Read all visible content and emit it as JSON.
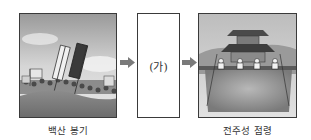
{
  "diagram": {
    "type": "sequence",
    "steps": [
      {
        "label": "백산 봉기",
        "image": "donghak-peasant-army-uprising-illustration"
      },
      {
        "label": "(가)",
        "image": null
      },
      {
        "label": "전주성 점령",
        "image": "jeonju-fortress-occupation-illustration"
      }
    ],
    "arrow_color": "#7a7a7a"
  }
}
